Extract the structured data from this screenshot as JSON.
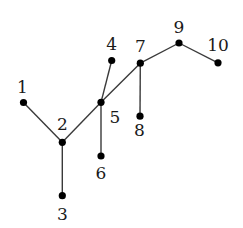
{
  "diagram": {
    "type": "tree",
    "colors": {
      "edge": "#3a3a3a",
      "node": "#000000",
      "label": "#1a1a1a",
      "background": "#ffffff"
    },
    "nodes": [
      {
        "id": "1",
        "label": "1",
        "x": 23.5,
        "y": 102.5,
        "lx": 22.5,
        "ly": 86.5
      },
      {
        "id": "2",
        "label": "2",
        "x": 62.3,
        "y": 142.3,
        "lx": 62.3,
        "ly": 123.5
      },
      {
        "id": "3",
        "label": "3",
        "x": 62.3,
        "y": 195.7,
        "lx": 62.3,
        "ly": 213.5
      },
      {
        "id": "4",
        "label": "4",
        "x": 111.7,
        "y": 60.5,
        "lx": 111.7,
        "ly": 43.5
      },
      {
        "id": "5",
        "label": "5",
        "x": 101.0,
        "y": 102.3,
        "lx": 115.0,
        "ly": 117.0
      },
      {
        "id": "6",
        "label": "6",
        "x": 101.0,
        "y": 156.0,
        "lx": 101.0,
        "ly": 172.5
      },
      {
        "id": "7",
        "label": "7",
        "x": 140.3,
        "y": 63.2,
        "lx": 140.5,
        "ly": 46.0
      },
      {
        "id": "8",
        "label": "8",
        "x": 140.0,
        "y": 116.2,
        "lx": 139.5,
        "ly": 129.5
      },
      {
        "id": "9",
        "label": "9",
        "x": 179.0,
        "y": 43.0,
        "lx": 179.0,
        "ly": 26.7
      },
      {
        "id": "10",
        "label": "10",
        "x": 218.0,
        "y": 62.8,
        "lx": 218.0,
        "ly": 45.0
      }
    ],
    "edges": [
      [
        "1",
        "2"
      ],
      [
        "2",
        "3"
      ],
      [
        "2",
        "5"
      ],
      [
        "5",
        "4"
      ],
      [
        "5",
        "6"
      ],
      [
        "5",
        "7"
      ],
      [
        "7",
        "8"
      ],
      [
        "7",
        "9"
      ],
      [
        "9",
        "10"
      ]
    ]
  }
}
